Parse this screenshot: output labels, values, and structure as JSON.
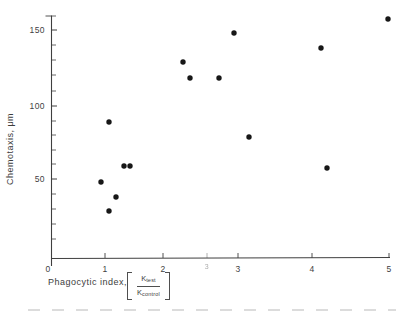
{
  "style": {
    "background": "#ffffff",
    "ink": "#3f3f3f",
    "dot_color": "#171717",
    "ghost_opacity": 0.45
  },
  "chart_data": {
    "type": "scatter",
    "title": "",
    "ylabel": "Chemotaxis, μm",
    "xlabel": "Phagocytic index, [K_test / K_control]",
    "xlabel_text": "Phagocytic index,",
    "fraction": {
      "num_base": "K",
      "num_sub": "test",
      "den_base": "K",
      "den_sub": "control"
    },
    "xlim": [
      0,
      5
    ],
    "ylim": [
      0,
      160
    ],
    "grid": false,
    "legend": null,
    "marker": "filled-circle",
    "x_ticks": [
      {
        "label": "0",
        "px": 48,
        "tick_below": true
      },
      {
        "label": "1",
        "px": 105
      },
      {
        "label": "2",
        "px": 163
      },
      {
        "label": "3",
        "px": 207,
        "ghost": true
      },
      {
        "label": "3",
        "px": 238
      },
      {
        "label": "4",
        "px": 312
      },
      {
        "label": "5",
        "px": 389
      }
    ],
    "y_ticks_major": [
      {
        "label": "50",
        "py": 179
      },
      {
        "label": "100",
        "py": 106
      },
      {
        "label": "150",
        "py": 30
      }
    ],
    "y_ticks_minor_py": [
      16,
      45,
      60,
      75,
      91,
      121,
      135,
      150,
      164,
      194,
      209,
      224,
      239
    ],
    "points": [
      {
        "x": 0.9,
        "y": 50,
        "px": 101,
        "py": 182
      },
      {
        "x": 1.05,
        "y": 90,
        "px": 109,
        "py": 122
      },
      {
        "x": 1.05,
        "y": 30,
        "px": 109,
        "py": 211
      },
      {
        "x": 1.15,
        "y": 40,
        "px": 116,
        "py": 197
      },
      {
        "x": 1.3,
        "y": 60,
        "px": 124,
        "py": 166
      },
      {
        "x": 1.4,
        "y": 60,
        "px": 130,
        "py": 166
      },
      {
        "x": 2.3,
        "y": 130,
        "px": 183,
        "py": 62
      },
      {
        "x": 2.4,
        "y": 120,
        "px": 190,
        "py": 78
      },
      {
        "x": 2.75,
        "y": 120,
        "px": 219,
        "py": 78
      },
      {
        "x": 2.95,
        "y": 148,
        "px": 234,
        "py": 33
      },
      {
        "x": 3.15,
        "y": 79,
        "px": 249,
        "py": 137
      },
      {
        "x": 4.1,
        "y": 139,
        "px": 321,
        "py": 48
      },
      {
        "x": 4.2,
        "y": 58,
        "px": 327,
        "py": 168
      },
      {
        "x": 5.0,
        "y": 157,
        "px": 388,
        "py": 19
      }
    ]
  }
}
